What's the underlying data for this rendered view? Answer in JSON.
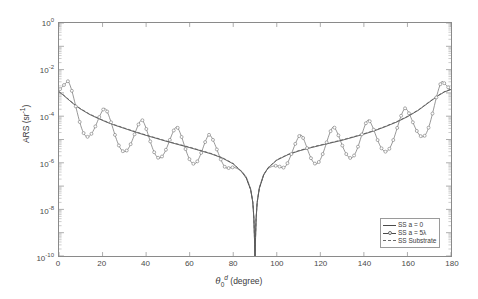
{
  "chart_data": {
    "type": "line",
    "title": "",
    "xlabel": "θ₀ᵈ (degree)",
    "xlabel_parts": {
      "symbol": "θ",
      "sub": "0",
      "sup": "d",
      "unit": "(degree)"
    },
    "ylabel": "ARS (sr⁻¹)",
    "ylabel_parts": {
      "text": "ARS (sr",
      "sup": "-1",
      "tail": ")"
    },
    "xlim": [
      0,
      180
    ],
    "ylim": [
      1e-10,
      1
    ],
    "yscale": "log",
    "xscale": "linear",
    "grid": false,
    "legend_position": "lower right",
    "xticks": [
      0,
      20,
      40,
      60,
      80,
      100,
      120,
      140,
      160,
      180
    ],
    "xticklabels": [
      "0",
      "20",
      "40",
      "60",
      "80",
      "100",
      "120",
      "140",
      "160",
      "180"
    ],
    "yticks": [
      1,
      0.01,
      0.0001,
      1e-06,
      1e-08,
      1e-10
    ],
    "yticklabels": [
      "10⁰",
      "10⁻²",
      "10⁻⁴",
      "10⁻⁶",
      "10⁻⁸",
      "10⁻¹⁰"
    ],
    "ytick_exponents": [
      "0",
      "-2",
      "-4",
      "-6",
      "-8",
      "-10"
    ],
    "series": [
      {
        "name": "SS a = 0",
        "style": "solid",
        "color": "#3f3f3f",
        "marker": "none",
        "x": [
          0,
          2,
          4,
          6,
          8,
          10,
          14,
          18,
          22,
          26,
          30,
          35,
          40,
          45,
          50,
          55,
          60,
          65,
          70,
          75,
          80,
          84,
          86,
          88,
          89,
          89.5,
          90,
          90.5,
          91,
          92,
          94,
          96,
          100,
          105,
          110,
          115,
          120,
          125,
          130,
          135,
          140,
          145,
          150,
          155,
          160,
          165,
          170,
          174,
          177,
          180
        ],
        "y": [
          0.0011,
          0.0008,
          0.00055,
          0.00038,
          0.00027,
          0.0002,
          0.00012,
          8e-05,
          5.5e-05,
          4e-05,
          3e-05,
          2.1e-05,
          1.5e-05,
          1.1e-05,
          8e-06,
          6e-06,
          4.5e-06,
          3.3e-06,
          2.4e-06,
          1.6e-06,
          9e-07,
          4e-07,
          2.2e-07,
          7e-08,
          2e-08,
          4e-09,
          1e-10,
          4e-09,
          2e-08,
          8e-08,
          3e-07,
          6e-07,
          1.3e-06,
          2.2e-06,
          3.2e-06,
          4.3e-06,
          5.6e-06,
          7.2e-06,
          9.3e-06,
          1.25e-05,
          1.7e-05,
          2.4e-05,
          3.6e-05,
          5.6e-05,
          9.5e-05,
          0.00018,
          0.0004,
          0.00075,
          0.0011,
          0.0014
        ]
      },
      {
        "name": "SS a = 5λ",
        "style": "solid-marker",
        "color": "#6a6a6a",
        "marker": "o",
        "comment": "oscillatory lobed curve with open-circle markers; lobe peaks decay toward 90 degrees and are symmetric about 90",
        "lobe_peaks_x": [
          4,
          21,
          38,
          54,
          69,
          111,
          126,
          142,
          159,
          176
        ],
        "lobe_peaks_y": [
          0.0032,
          0.00022,
          7e-05,
          3.5e-05,
          1.6e-05,
          1.6e-05,
          3.5e-05,
          7e-05,
          0.00022,
          0.0032
        ],
        "lobe_nulls_x": [
          13,
          30,
          46,
          62,
          78,
          102,
          118,
          134,
          150,
          167
        ],
        "lobe_nulls_y": [
          1.3e-05,
          3e-06,
          1.6e-06,
          9e-07,
          5e-07,
          5e-07,
          9e-07,
          1.6e-06,
          3e-06,
          1.3e-05
        ]
      },
      {
        "name": "SS Substrate",
        "style": "dashed",
        "color": "#7a7a7a",
        "marker": "none",
        "comment": "dashed baseline nearly coincident with the SS a = 0 solid curve"
      }
    ],
    "legend": [
      {
        "label": "SS a = 0",
        "style": "solid",
        "marker": "none"
      },
      {
        "label": "SS a = 5λ",
        "style": "solid",
        "marker": "o"
      },
      {
        "label": "SS Substrate",
        "style": "dashed",
        "marker": "none"
      }
    ]
  },
  "axis": {
    "y_title_main": "ARS (sr",
    "y_title_sup": "-1",
    "y_title_tail": ")",
    "x_title_symbol": "θ",
    "x_title_sub": "0",
    "x_title_sup": "d",
    "x_title_unit": "(degree)"
  },
  "colors": {
    "axis": "#8a8a8a",
    "text": "#3a3a3a",
    "curve_solid": "#3f3f3f",
    "curve_marker": "#6a6a6a",
    "curve_dashed": "#7a7a7a",
    "background": "#ffffff"
  }
}
